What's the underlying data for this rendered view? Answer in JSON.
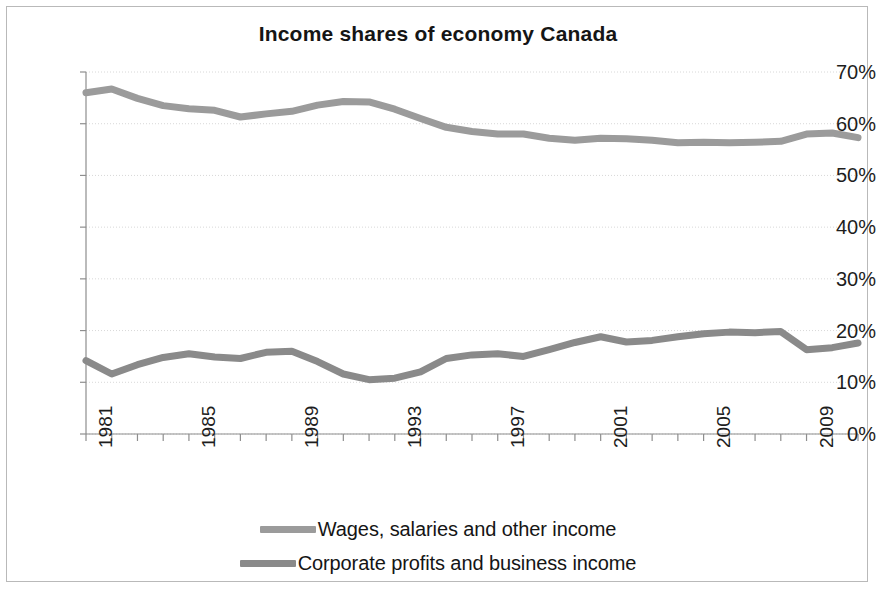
{
  "chart_data": {
    "type": "line",
    "title": "Income shares of economy Canada",
    "xlabel": "",
    "ylabel": "",
    "ylim": [
      0,
      70
    ],
    "ytick_labels": [
      "0%",
      "10%",
      "20%",
      "30%",
      "40%",
      "50%",
      "60%",
      "70%"
    ],
    "ytick_values": [
      0,
      10,
      20,
      30,
      40,
      50,
      60,
      70
    ],
    "xlim": [
      1981,
      2011
    ],
    "xtick_labels": [
      "1981",
      "1985",
      "1989",
      "1993",
      "1997",
      "2001",
      "2005",
      "2009"
    ],
    "xtick_values": [
      1981,
      1985,
      1989,
      1993,
      1997,
      2001,
      2005,
      2009
    ],
    "x": [
      1981,
      1982,
      1983,
      1984,
      1985,
      1986,
      1987,
      1988,
      1989,
      1990,
      1991,
      1992,
      1993,
      1994,
      1995,
      1996,
      1997,
      1998,
      1999,
      2000,
      2001,
      2002,
      2003,
      2004,
      2005,
      2006,
      2007,
      2008,
      2009,
      2010,
      2011
    ],
    "grid": true,
    "grid_axis": "y",
    "legend_position": "bottom",
    "series": [
      {
        "name": "Wages, salaries and other income",
        "color": "#9b9b9b",
        "values": [
          66.0,
          66.7,
          64.9,
          63.5,
          62.9,
          62.6,
          61.3,
          61.9,
          62.4,
          63.6,
          64.3,
          64.2,
          62.8,
          61.0,
          59.3,
          58.5,
          58.0,
          58.0,
          57.2,
          56.8,
          57.2,
          57.1,
          56.8,
          56.3,
          56.4,
          56.3,
          56.4,
          56.6,
          58.0,
          58.2,
          57.3
        ]
      },
      {
        "name": "Corporate profits and business income",
        "color": "#8a8a8a",
        "values": [
          14.2,
          11.6,
          13.4,
          14.8,
          15.5,
          14.9,
          14.6,
          15.8,
          16.0,
          14.0,
          11.6,
          10.5,
          10.8,
          12.0,
          14.6,
          15.3,
          15.5,
          15.0,
          16.3,
          17.7,
          18.8,
          17.8,
          18.1,
          18.8,
          19.4,
          19.7,
          19.6,
          19.8,
          16.3,
          16.7,
          17.6
        ]
      }
    ]
  },
  "legend": [
    {
      "label": "Wages, salaries and other income",
      "color": "#9b9b9b"
    },
    {
      "label": "Corporate profits and business income",
      "color": "#8a8a8a"
    }
  ]
}
